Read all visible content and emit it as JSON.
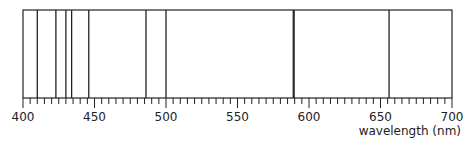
{
  "diagram": {
    "type": "emission-spectrum",
    "axis": {
      "min": 400,
      "max": 700,
      "major_ticks": [
        400,
        450,
        500,
        550,
        600,
        650,
        700
      ],
      "minor_step": 5,
      "label": "wavelength (nm)"
    },
    "lines_nm": [
      410,
      423,
      430,
      434,
      446,
      486,
      500,
      589,
      589.6,
      656
    ],
    "colors": {
      "stroke": "#222222",
      "background": "#ffffff"
    }
  }
}
